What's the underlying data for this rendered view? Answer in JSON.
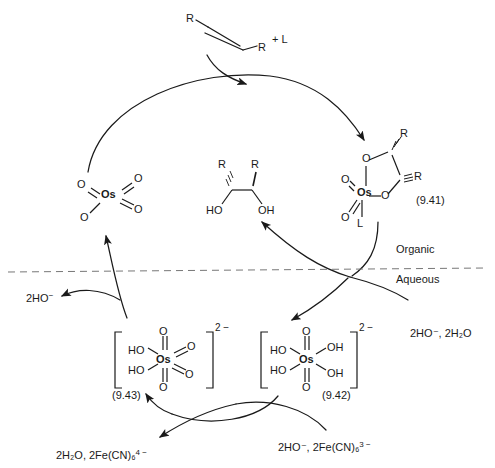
{
  "diagram": {
    "type": "reaction-cycle",
    "phases": {
      "upper": "Organic",
      "lower": "Aqueous"
    }
  },
  "substrate": {
    "r_left": "R",
    "r_right": "R",
    "ligand_add": "+ L"
  },
  "osmium_tetroxide": {
    "center": "Os",
    "o_upper_left": "O",
    "o_lower_left": "O",
    "o_upper_right": "O",
    "o_lower_right": "O"
  },
  "osmate_ester": {
    "label": "(9.41)",
    "center": "Os",
    "ring_o_top": "O",
    "ring_o_right": "O",
    "oxo_left": "O",
    "oxo_lower_left": "O",
    "ligand": "L",
    "r_top": "R",
    "r_right": "R"
  },
  "diol": {
    "r_left": "R",
    "r_right": "R",
    "oh_left": "HO",
    "oh_right": "OH"
  },
  "species_942": {
    "label": "(9.42)",
    "center": "Os",
    "charge": "2 −",
    "ho_upper_left": "HO",
    "ho_lower_left": "HO",
    "oh_upper_right": "OH",
    "oh_lower_right": "OH",
    "oxo_top": "O",
    "oxo_bottom": "O"
  },
  "species_943": {
    "label": "(9.43)",
    "center": "Os",
    "charge": "2 −",
    "ho_upper_left": "HO",
    "ho_lower_left": "HO",
    "o_upper_right": "O",
    "o_lower_right": "O",
    "oxo_top": "O",
    "oxo_bottom": "O"
  },
  "reagents": {
    "hydroxide_out": "2HO",
    "hydroxide_out_charge": "−",
    "entry_right": "2HO⁻, 2H₂O",
    "oxidant_in": "2HO⁻, 2Fe(CN)₆",
    "oxidant_in_charge": "3 −",
    "byproduct_out": "2H₂O, 2Fe(CN)₆",
    "byproduct_out_charge": "4 −"
  }
}
